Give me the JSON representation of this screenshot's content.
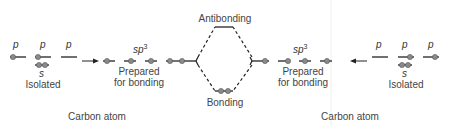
{
  "diagram": {
    "left_atom": {
      "isolated": {
        "orbitals": [
          {
            "label": "p",
            "electrons": 1
          },
          {
            "label": "p",
            "electrons": 1
          },
          {
            "label": "p",
            "electrons": 0
          },
          {
            "label": "s",
            "electrons": 2
          }
        ],
        "state_label": "Isolated"
      },
      "prepared": {
        "orbital_label": "sp",
        "orbital_superscript": "3",
        "electrons_per_orbital": [
          1,
          1,
          1,
          1
        ],
        "state_label_line1": "Prepared",
        "state_label_line2": "for bonding"
      },
      "caption": "Carbon atom"
    },
    "right_atom": {
      "isolated": {
        "orbitals": [
          {
            "label": "p",
            "electrons": 0
          },
          {
            "label": "p",
            "electrons": 1
          },
          {
            "label": "p",
            "electrons": 1
          },
          {
            "label": "s",
            "electrons": 2
          }
        ],
        "state_label": "Isolated"
      },
      "prepared": {
        "orbital_label": "sp",
        "orbital_superscript": "3",
        "electrons_per_orbital": [
          1,
          1,
          1,
          1
        ],
        "state_label_line1": "Prepared",
        "state_label_line2": "for bonding"
      },
      "caption": "Carbon atom"
    },
    "molecular_orbitals": {
      "antibonding_label": "Antibonding",
      "bonding_label": "Bonding",
      "antibonding_electrons": 0,
      "bonding_electrons": 2
    },
    "colors": {
      "line": "#222222",
      "electron": "#8a8a8a",
      "text": "#444444"
    }
  }
}
